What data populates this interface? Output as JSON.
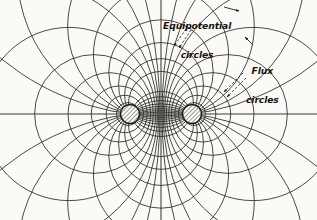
{
  "figure": {
    "background_color": "#fbfaf7",
    "ink_color": "#262421",
    "width": 317,
    "height": 220
  },
  "annotations": [
    {
      "id": "equipotential",
      "line_1": "Equipotential",
      "line_2": "circles",
      "leader_style": "dashed-double-arrow"
    },
    {
      "id": "flux",
      "line_1": "Flux",
      "line_2": "circles",
      "leader_style": "dashed-double-arrow"
    }
  ],
  "chart_data": {
    "type": "diagram",
    "subtype": "apollonian-circle-field-map",
    "xlabel": "",
    "ylabel": "",
    "grid": false,
    "legend_position": "inline-callouts",
    "xlim": [
      0,
      317
    ],
    "ylim": [
      0,
      220
    ],
    "axes": {
      "horizontal_axis": {
        "y": 114,
        "x_start": 0,
        "x_end": 317
      },
      "vertical_axis": {
        "x": 161,
        "y_start": 0,
        "y_end": 220
      }
    },
    "conductors": [
      {
        "name": "left-conductor",
        "cx": 130,
        "cy": 114,
        "r": 9.5,
        "fill": "diagonal-hatch"
      },
      {
        "name": "right-conductor",
        "cx": 192,
        "cy": 114,
        "r": 9.5,
        "fill": "diagonal-hatch"
      }
    ],
    "focal_points": [
      {
        "name": "left-focus",
        "x": 130,
        "y": 114
      },
      {
        "name": "right-focus",
        "x": 192,
        "y": 114
      }
    ],
    "half_separation": 31,
    "center_x": 161,
    "center_y": 114,
    "equipotential_circles": {
      "description": "Circles of constant potential; centers lie on the horizontal axis, coaxial family about the two foci",
      "parameter": "k = ratio of distances to the two foci",
      "k_values": [
        1.07,
        1.15,
        1.26,
        1.42,
        1.65,
        2.0,
        2.6,
        3.6,
        5.6,
        11.0
      ],
      "count_per_side": 10,
      "total": 20
    },
    "flux_circles": {
      "description": "Orthogonal family of flux lines; every circle passes through both conductor centers",
      "parameter": "center offset along the vertical axis",
      "center_offsets": [
        10,
        19,
        29,
        42,
        60,
        88,
        140,
        250
      ],
      "count_per_side": 8,
      "total": 16
    }
  }
}
